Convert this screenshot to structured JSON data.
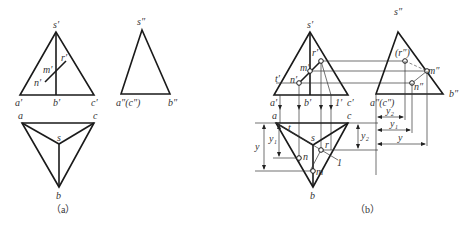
{
  "figure": {
    "panels": [
      {
        "caption": "（a）",
        "front_view": {
          "labels": {
            "s": "s′",
            "a": "a′",
            "b": "b′",
            "c": "c′",
            "m": "m′",
            "n": "n′",
            "r": "r′"
          }
        },
        "side_view": {
          "labels": {
            "s": "s″",
            "ac": "a″(c″)",
            "b": "b″"
          }
        },
        "top_view": {
          "labels": {
            "a": "a",
            "c": "c",
            "s": "s",
            "b": "b"
          }
        }
      },
      {
        "caption": "（b）",
        "front_view": {
          "labels": {
            "s": "s′",
            "a": "a′",
            "b": "b′",
            "c": "c′",
            "m": "m′",
            "n": "n′",
            "r": "r′",
            "t": "t′",
            "one": "1′"
          }
        },
        "side_view": {
          "labels": {
            "s": "s″",
            "ac": "a″(c″)",
            "b": "b″",
            "m": "m″",
            "n": "n″",
            "r": "(r″)"
          }
        },
        "top_view": {
          "labels": {
            "a": "a",
            "c": "c",
            "s": "s",
            "b": "b",
            "n": "n",
            "m": "m",
            "r": "r",
            "t": "t",
            "one": "1"
          }
        },
        "dimensions": {
          "y": "y",
          "y1": "y₁",
          "y2": "y₂"
        }
      }
    ]
  }
}
